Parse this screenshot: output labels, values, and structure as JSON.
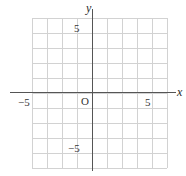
{
  "figure": {
    "type": "cartesian-coordinate-plane",
    "background_color": "#ffffff",
    "grid_color": "#d2d2d2",
    "axis_color": "#555555",
    "label_color": "#333333"
  },
  "axes": {
    "x_axis_name": "x",
    "y_axis_name": "y",
    "origin_label": "O",
    "x_range": [
      -6,
      6
    ],
    "y_range": [
      -6,
      6
    ],
    "tick_interval": 1,
    "labeled_ticks": {
      "x_negative": "−5",
      "x_positive": "5",
      "y_positive": "5",
      "y_negative": "−5"
    }
  },
  "grid": {
    "visible": true,
    "columns": 9,
    "rows": 10,
    "cell_size_px": 15,
    "vertical_lines": [
      0,
      15,
      30,
      45,
      60,
      75,
      90,
      105,
      120,
      135
    ],
    "horizontal_lines": [
      0,
      15,
      30,
      45,
      60,
      75,
      90,
      105,
      120,
      135,
      150
    ]
  }
}
